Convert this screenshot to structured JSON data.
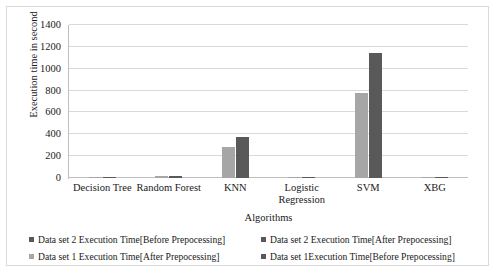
{
  "chart_data": {
    "type": "bar",
    "title": "",
    "xlabel": "Algorithms",
    "ylabel": "Execution time in second",
    "categories": [
      "Decision Tree",
      "Random Forest",
      "KNN",
      "Logistic Regression",
      "SVM",
      "XBG"
    ],
    "ylim": [
      0,
      1400
    ],
    "yticks": [
      0,
      200,
      400,
      600,
      800,
      1000,
      1200,
      1400
    ],
    "ytick_labels": [
      "0",
      "200",
      "400",
      "600",
      "800",
      "1000",
      "1200",
      "1400"
    ],
    "grid": true,
    "legend_position": "bottom",
    "series": [
      {
        "name": "Data set 1 Execution Time[After Prepocessing]",
        "color": "#a6a6a6",
        "values": [
          1,
          15,
          280,
          1,
          780,
          8
        ]
      },
      {
        "name": "Data set 2 Execution Time[After Prepocessing]",
        "color": "#595959",
        "values": [
          2,
          20,
          375,
          2,
          1140,
          9
        ]
      }
    ],
    "legend_entries": [
      {
        "label": "Data set 2 Execution Time[Before Prepocessing]",
        "color": "#595959"
      },
      {
        "label": "Data set 2 Execution Time[After Prepocessing]",
        "color": "#595959"
      },
      {
        "label": "Data set 1 Execution Time[After Prepocessing]",
        "color": "#a6a6a6"
      },
      {
        "label": "Data set 1Execution Time[Before Prepocessing]",
        "color": "#595959"
      }
    ]
  }
}
